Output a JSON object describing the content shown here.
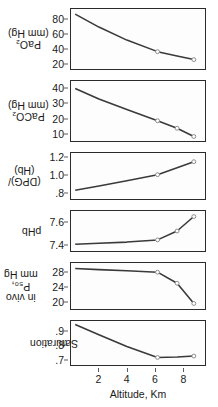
{
  "figure": {
    "xlabel": "Altitude, Km",
    "xticks": [
      "2",
      "4",
      "6",
      "8"
    ],
    "xlim": [
      0,
      9.6
    ],
    "marker_color": "#8a8a8a",
    "line_color": "#3a3a3a",
    "axis_color": "#2b2b2b"
  },
  "chart_data": [
    {
      "type": "line",
      "title": "",
      "ylabel": "PaO2 (mm Hg)",
      "ylabel_lines": [
        "PaO₂",
        "(mm Hg)"
      ],
      "xlabel": "Altitude, Km",
      "yticks": [
        80,
        60,
        40,
        20
      ],
      "ylim": [
        12,
        95
      ],
      "xlim": [
        0,
        9.6
      ],
      "grid": false,
      "x": [
        0.3,
        2.0,
        4.0,
        6.2,
        7.6,
        8.8
      ],
      "values": [
        88,
        70,
        52,
        36,
        30,
        25
      ],
      "markers_x": [
        6.2,
        8.8
      ],
      "markers_y": [
        36,
        25
      ]
    },
    {
      "type": "line",
      "title": "",
      "ylabel": "PaCO2 (mm Hg)",
      "ylabel_lines": [
        "PaCO₂",
        "(mm Hg)"
      ],
      "xlabel": "Altitude, Km",
      "yticks": [
        40,
        30,
        20,
        10
      ],
      "ylim": [
        5,
        45
      ],
      "xlim": [
        0,
        9.6
      ],
      "grid": false,
      "x": [
        0.3,
        2.0,
        4.0,
        6.2,
        7.6,
        8.8
      ],
      "values": [
        40,
        33,
        26,
        18.5,
        13.5,
        8
      ],
      "markers_x": [
        6.2,
        7.6,
        8.8
      ],
      "markers_y": [
        18.5,
        13.5,
        8
      ]
    },
    {
      "type": "line",
      "title": "",
      "ylabel": "(DPG)/(Hb)",
      "ylabel_lines": [
        "(DPG)/",
        "(Hb)"
      ],
      "xlabel": "Altitude, Km",
      "yticks": [
        "1.2",
        "1.0",
        ".8"
      ],
      "ytickvals": [
        1.2,
        1.0,
        0.8
      ],
      "ylim": [
        0.72,
        1.25
      ],
      "xlim": [
        0,
        9.6
      ],
      "grid": false,
      "x": [
        0.3,
        2.0,
        4.0,
        6.2,
        7.6,
        8.8
      ],
      "values": [
        0.82,
        0.87,
        0.93,
        1.0,
        1.08,
        1.15
      ],
      "markers_x": [
        6.2,
        8.8
      ],
      "markers_y": [
        1.0,
        1.15
      ]
    },
    {
      "type": "line",
      "title": "",
      "ylabel": "pHb",
      "ylabel_lines": [
        "pHb"
      ],
      "xlabel": "Altitude, Km",
      "yticks": [
        "7.6",
        "7.4"
      ],
      "ytickvals": [
        7.6,
        7.4
      ],
      "ylim": [
        7.34,
        7.7
      ],
      "xlim": [
        0,
        9.6
      ],
      "grid": false,
      "x": [
        0.3,
        2.0,
        4.0,
        6.2,
        7.6,
        8.8
      ],
      "values": [
        7.4,
        7.41,
        7.42,
        7.44,
        7.52,
        7.65
      ],
      "markers_x": [
        6.2,
        7.6,
        8.8
      ],
      "markers_y": [
        7.44,
        7.52,
        7.65
      ]
    },
    {
      "type": "line",
      "title": "",
      "ylabel": "in vivo P50, mm Hg",
      "ylabel_lines": [
        "in vivo",
        "P₅₀,",
        "mm Hg"
      ],
      "xlabel": "Altitude, Km",
      "yticks": [
        28,
        24,
        20
      ],
      "ylim": [
        18,
        30.5
      ],
      "xlim": [
        0,
        9.6
      ],
      "grid": false,
      "x": [
        0.3,
        2.0,
        4.0,
        6.2,
        7.6,
        8.8
      ],
      "values": [
        29,
        28.7,
        28.4,
        28,
        25,
        19.5
      ],
      "markers_x": [
        6.2,
        7.6,
        8.8
      ],
      "markers_y": [
        28,
        25,
        19.5
      ]
    },
    {
      "type": "line",
      "title": "",
      "ylabel": "Saturation",
      "ylabel_lines": [
        "Saturation"
      ],
      "xlabel": "Altitude, Km",
      "yticks": [
        ".9",
        ".8",
        ".7"
      ],
      "ytickvals": [
        0.9,
        0.8,
        0.7
      ],
      "ylim": [
        0.655,
        0.975
      ],
      "xlim": [
        0,
        9.6
      ],
      "grid": false,
      "x": [
        0.3,
        2.0,
        4.0,
        6.2,
        7.6,
        8.8
      ],
      "values": [
        0.95,
        0.875,
        0.79,
        0.71,
        0.713,
        0.72
      ],
      "markers_x": [
        6.2,
        8.8
      ],
      "markers_y": [
        0.71,
        0.72
      ]
    }
  ]
}
